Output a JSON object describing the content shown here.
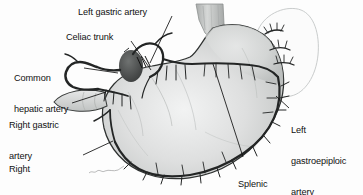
{
  "figure": {
    "type": "anatomical-illustration",
    "style": "grayscale pen-and-wash medical illustration",
    "background_color": "#fdfdfd",
    "label_color": "#111111",
    "leader_line_color": "#1a1a1a",
    "vessel_color": "#2b2b2b",
    "organ_fill_color": "#d9dbda",
    "spleen_outline_color": "#c9cbcb"
  },
  "labels": {
    "left_gastric_artery": "Left gastric artery",
    "celiac_trunk": "Celiac trunk",
    "common_hepatic_artery_line1": "Common",
    "common_hepatic_artery_line2": "hepatic artery",
    "right_gastric_artery_line1": "Right gastric",
    "right_gastric_artery_line2": "artery",
    "right_gastroepiploic_artery_line1": "Right",
    "right_gastroepiploic_artery_line2": "gastroepiploic",
    "right_gastroepiploic_artery_line3": "artery",
    "left_gastroepiploic_artery_line1": "Left",
    "left_gastroepiploic_artery_line2": "gastroepiploic",
    "left_gastroepiploic_artery_line3": "artery",
    "splenic_artery_line1": "Splenic",
    "splenic_artery_line2": "artery"
  },
  "structures": [
    {
      "name": "esophagus",
      "description": "tubular structure entering at top center"
    },
    {
      "name": "stomach-fundus",
      "description": "dome of stomach upper right"
    },
    {
      "name": "stomach-body",
      "description": "large curved body of stomach"
    },
    {
      "name": "pylorus",
      "description": "narrowed outlet at left"
    },
    {
      "name": "duodenum",
      "description": "short segment continuing from pylorus"
    },
    {
      "name": "spleen",
      "description": "faint outline at upper right"
    },
    {
      "name": "celiac-trunk-vessel",
      "description": "dark bulbous trunk near center-left"
    },
    {
      "name": "left-gastric-artery-vessel",
      "description": "runs along lesser curvature"
    },
    {
      "name": "common-hepatic-artery-vessel",
      "description": "branches to the left from celiac trunk"
    },
    {
      "name": "splenic-artery-vessel",
      "description": "horizontal vessel running to spleen"
    },
    {
      "name": "right-gastric-artery-vessel",
      "description": "loops near the pylorus"
    },
    {
      "name": "right-gastroepiploic-artery-vessel",
      "description": "along greater curvature, left portion"
    },
    {
      "name": "left-gastroepiploic-artery-vessel",
      "description": "along greater curvature, right portion"
    },
    {
      "name": "short-gastric-arteries",
      "description": "small branches to fundus near spleen"
    }
  ],
  "artist_signature": ""
}
